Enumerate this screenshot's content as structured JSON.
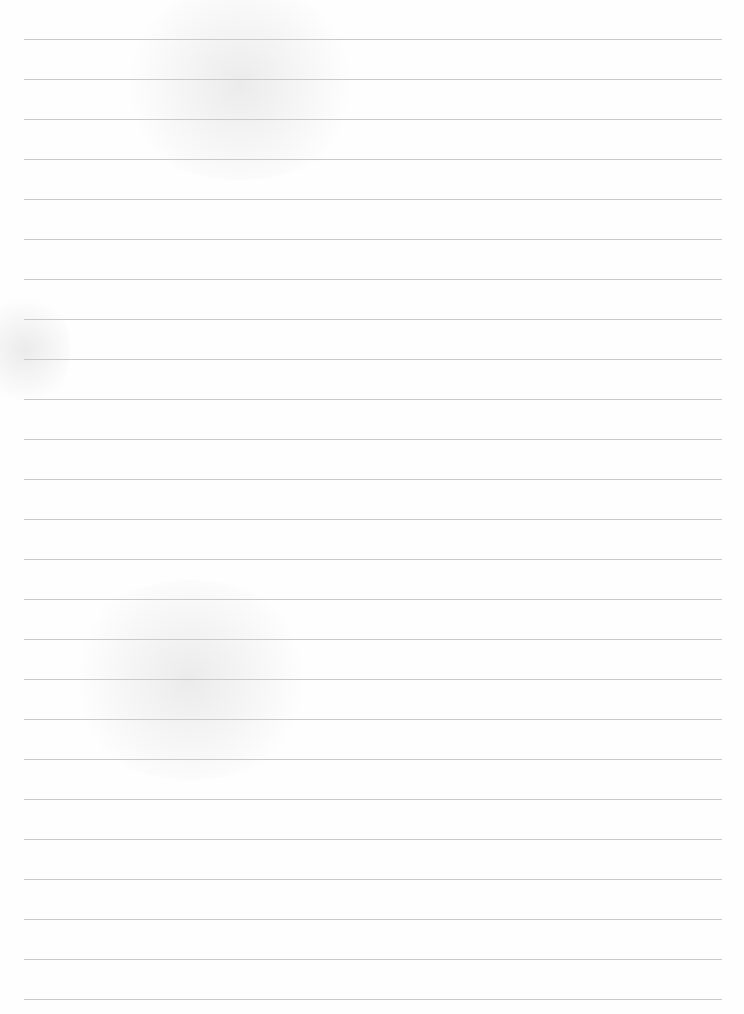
{
  "document": {
    "type": "blank lined paper",
    "text_content": "",
    "line_count": 25,
    "line_spacing_px": 40,
    "first_line_y": 39,
    "line_left_x": 24,
    "line_right_x": 722
  },
  "colors": {
    "paper": "#fefefe",
    "rule": "#c9c9c9"
  }
}
